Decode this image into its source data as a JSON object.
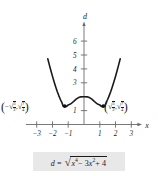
{
  "figure": {
    "axis_label_y": "d",
    "axis_label_x": "x",
    "formula": "d = √(x⁴ − 3x² + 4)",
    "formula_parts": {
      "lhs": "d",
      "equals": "=",
      "radicand_base1": "x",
      "radicand_exp1": "4",
      "minus": "− 3",
      "radicand_base2": "x",
      "radicand_exp2": "2",
      "plus": "+ 4",
      "radical_symbol": "√"
    },
    "left_label": {
      "open": "(",
      "sign": "−",
      "radical1": "√",
      "frac1_num": "3",
      "frac1_den": "2",
      "comma": ",",
      "radical2": "√",
      "frac2_num": "7",
      "frac2_den": "4",
      "close": ")"
    },
    "right_label": {
      "open": "(",
      "radical1": "√",
      "frac1_num": "3",
      "frac1_den": "2",
      "comma": ",",
      "radical2": "√",
      "frac2_num": "7",
      "frac2_den": "4",
      "close": ")"
    },
    "colors": {
      "curve": "#1a1a1a",
      "axis": "#6b6b6b",
      "text": "#1a1a1a",
      "formula_box": "#e8e8e8",
      "background": "#ffffff"
    }
  },
  "chart_data": {
    "type": "line",
    "title": "",
    "subtitle": "",
    "xlabel": "x",
    "ylabel": "d",
    "equation": "d = sqrt(x^4 - 3x^2 + 4)",
    "xlim": [
      -3.6,
      3.6
    ],
    "ylim": [
      0,
      7.2
    ],
    "xticks": [
      -3,
      -2,
      -1,
      1,
      2,
      3
    ],
    "xticklabels": [
      "−3",
      "−2",
      "−1",
      "1",
      "2",
      "3"
    ],
    "yticks": [
      1,
      3,
      4,
      5,
      6
    ],
    "yticklabels": [
      "1",
      "3",
      "4",
      "5",
      "6"
    ],
    "yticks_unlabeled": [
      2
    ],
    "grid": false,
    "legend": false,
    "series": [
      {
        "name": "d = sqrt(x^4 - 3x^2 + 4)",
        "x": [
          -2.3,
          -2.2,
          -2.1,
          -2.0,
          -1.9,
          -1.8,
          -1.7,
          -1.6,
          -1.5,
          -1.4,
          -1.3229,
          -1.2,
          -1.1,
          -1.0,
          -0.9,
          -0.8,
          -0.7,
          -0.6,
          -0.5,
          -0.4,
          -0.3,
          -0.2,
          -0.1,
          0.0,
          0.1,
          0.2,
          0.3,
          0.4,
          0.5,
          0.6,
          0.7,
          0.8,
          0.9,
          1.0,
          1.1,
          1.2,
          1.3229,
          1.4,
          1.5,
          1.6,
          1.7,
          1.8,
          1.9,
          2.0,
          2.1,
          2.2,
          2.3
        ],
        "y": [
          4.73,
          4.29,
          3.87,
          3.46,
          3.08,
          2.72,
          2.38,
          2.08,
          1.8,
          1.57,
          1.3229,
          1.33,
          1.3,
          1.41,
          1.45,
          1.52,
          1.62,
          1.72,
          1.82,
          1.9,
          1.96,
          1.99,
          2.0,
          2.0,
          2.0,
          1.99,
          1.96,
          1.9,
          1.82,
          1.72,
          1.62,
          1.52,
          1.45,
          1.41,
          1.3,
          1.33,
          1.3229,
          1.57,
          1.8,
          2.08,
          2.38,
          2.72,
          3.08,
          3.46,
          3.87,
          4.29,
          4.73
        ],
        "color": "#1a1a1a"
      }
    ],
    "annotated_points": [
      {
        "label": "(−√(3/2), √(7/4))",
        "x": -1.2247,
        "y": 1.3229
      },
      {
        "label": "(√(3/2), √(7/4))",
        "x": 1.2247,
        "y": 1.3229
      }
    ],
    "axis_arrows": [
      "x-positive",
      "y-positive"
    ]
  }
}
